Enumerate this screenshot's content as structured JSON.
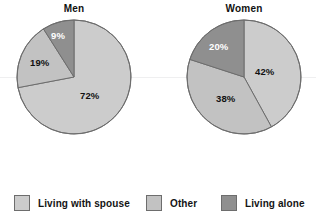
{
  "figure": {
    "background": "#ffffff",
    "outline_color": "#6d6d6d"
  },
  "charts": [
    {
      "id": "men",
      "title": "Men",
      "center": {
        "x": 74,
        "y": 77
      },
      "radius": 57,
      "labels": [
        {
          "text": "72%",
          "x": 80,
          "y": 90,
          "style": "dark"
        },
        {
          "text": "19%",
          "x": 30,
          "y": 57,
          "style": "dark"
        },
        {
          "text": "9%",
          "x": 51,
          "y": 30,
          "style": "light"
        }
      ]
    },
    {
      "id": "women",
      "title": "Women",
      "center": {
        "x": 244,
        "y": 77
      },
      "radius": 57,
      "labels": [
        {
          "text": "42%",
          "x": 255,
          "y": 66,
          "style": "dark"
        },
        {
          "text": "38%",
          "x": 216,
          "y": 93,
          "style": "dark"
        },
        {
          "text": "20%",
          "x": 209,
          "y": 41,
          "style": "light"
        }
      ]
    }
  ],
  "legend": {
    "items": [
      {
        "label": "Living  with spouse",
        "color": "#cccccc",
        "swatch_name": "legend-swatch-living-with-spouse"
      },
      {
        "label": "Other",
        "color": "#c2c2c2",
        "swatch_name": "legend-swatch-other"
      },
      {
        "label": "Living alone",
        "color": "#8f8f8f",
        "swatch_name": "legend-swatch-living-alone"
      }
    ]
  },
  "chart_data": {
    "type": "pie",
    "title": "",
    "subtitle": "",
    "legend_position": "bottom",
    "value_format": "percent",
    "categories": [
      "Living  with spouse",
      "Other",
      "Living alone"
    ],
    "colors": [
      "#cccccc",
      "#c2c2c2",
      "#8f8f8f"
    ],
    "charts": [
      {
        "title": "Men",
        "labels": [
          "Living  with spouse",
          "Other",
          "Living alone"
        ],
        "values": [
          72,
          19,
          9
        ],
        "value_labels": [
          "72%",
          "19%",
          "9%"
        ],
        "start_angle_deg": 0,
        "direction": "clockwise"
      },
      {
        "title": "Women",
        "labels": [
          "Living  with spouse",
          "Other",
          "Living alone"
        ],
        "values": [
          42,
          38,
          20
        ],
        "value_labels": [
          "42%",
          "38%",
          "20%"
        ],
        "start_angle_deg": 0,
        "direction": "clockwise"
      }
    ]
  }
}
